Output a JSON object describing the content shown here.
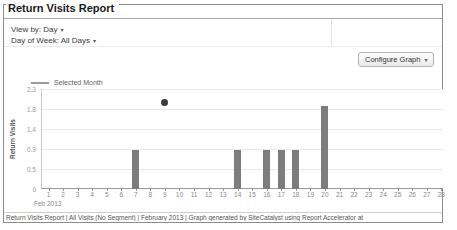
{
  "window": {
    "title": "Return Visits Report"
  },
  "filters": {
    "view_by_label": "View by: Day",
    "day_of_week_label": "Day of Week: All Days",
    "caret": "▾"
  },
  "toolbar": {
    "configure_graph_label": "Configure Graph",
    "caret": "▾"
  },
  "chart_data": {
    "type": "bar",
    "title": "Return Visits Report",
    "legend": [
      {
        "name": "Selected Month",
        "swatch": "line",
        "color": "#9a9a9a"
      }
    ],
    "legend_position": "top-left",
    "ylabel": "Return Visits",
    "ylim": [
      0,
      2.3
    ],
    "ytick_labels_top_to_bottom": [
      "2.3",
      "1.8",
      "1.4",
      "0.9",
      "0.5",
      "0"
    ],
    "grid": true,
    "x_axis_note": "Feb 2013",
    "categories": [
      1,
      2,
      3,
      4,
      5,
      6,
      7,
      8,
      9,
      10,
      11,
      12,
      13,
      14,
      15,
      16,
      17,
      18,
      19,
      20,
      21,
      22,
      23,
      24,
      25,
      26,
      27,
      28
    ],
    "values": [
      0,
      0,
      0,
      0,
      0,
      0,
      0.9,
      0,
      0,
      0,
      0,
      0,
      0,
      0.9,
      0,
      0.9,
      0.9,
      0.9,
      0,
      1.9,
      0,
      0,
      0,
      0,
      0,
      0,
      0,
      0
    ],
    "point_marker": {
      "x": 9,
      "value": 2.0,
      "color": "#3b3b3b"
    },
    "bar_color": "#7d7d7d"
  },
  "footer": {
    "text": "Return Visits Report | All Visits (No Segment) | February 2013 | Graph generated by SiteCatalyst using Report Accelerator at"
  }
}
